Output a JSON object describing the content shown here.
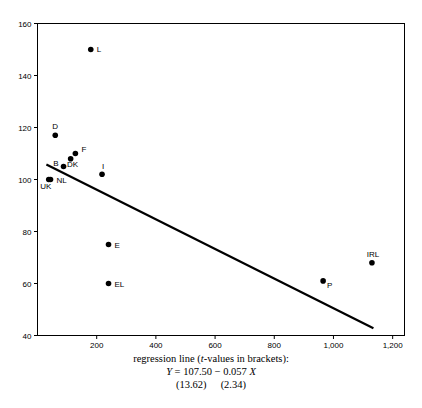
{
  "chart_data": {
    "type": "scatter",
    "title": "",
    "xlabel": "",
    "ylabel": "",
    "xlim": [
      0,
      1240
    ],
    "ylim": [
      40,
      160
    ],
    "grid": false,
    "legend": "none",
    "x_ticks": [
      "200",
      "400",
      "600",
      "800",
      "1,000",
      "1,200"
    ],
    "x_tick_values": [
      200,
      400,
      600,
      800,
      1000,
      1200
    ],
    "y_ticks": [
      "40",
      "60",
      "80",
      "100",
      "120",
      "140",
      "160"
    ],
    "y_tick_values": [
      40,
      60,
      80,
      100,
      120,
      140,
      160
    ],
    "points": [
      {
        "label": "L",
        "x": 180,
        "y": 150
      },
      {
        "label": "D",
        "x": 60,
        "y": 117
      },
      {
        "label": "F",
        "x": 128,
        "y": 110
      },
      {
        "label": "DK",
        "x": 112,
        "y": 108
      },
      {
        "label": "B",
        "x": 88,
        "y": 105
      },
      {
        "label": "I",
        "x": 218,
        "y": 102
      },
      {
        "label": "NL",
        "x": 44,
        "y": 100
      },
      {
        "label": "UK",
        "x": 38,
        "y": 100
      },
      {
        "label": "E",
        "x": 240,
        "y": 75
      },
      {
        "label": "EL",
        "x": 240,
        "y": 60
      },
      {
        "label": "P",
        "x": 965,
        "y": 61
      },
      {
        "label": "IRL",
        "x": 1130,
        "y": 68
      }
    ],
    "series": [
      {
        "name": "regression line",
        "type": "line",
        "intercept": 107.5,
        "slope": -0.057,
        "x_start": 30,
        "x_end": 1135
      }
    ],
    "annotations": {
      "caption_line1": "regression line (t-values in brackets):",
      "caption_line1_italic": "t",
      "equation_y": "Y",
      "equation_body": " = 107.50  −  0.057 ",
      "equation_x": "X",
      "tvalue_intercept": "(13.62)",
      "tvalue_slope": "(2.34)"
    }
  },
  "colors": {
    "axis": "#000000",
    "marker": "#000000",
    "regression_line": "#000000",
    "background": "#ffffff"
  }
}
